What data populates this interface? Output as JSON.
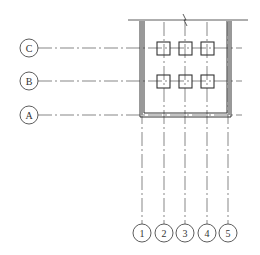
{
  "diagram": {
    "type": "structural-grid-plan",
    "colors": {
      "line": "#333333",
      "axis": "#555555",
      "wall": "#333333",
      "background": "#ffffff"
    },
    "row_axes": [
      {
        "label": "C",
        "y": 48
      },
      {
        "label": "B",
        "y": 81
      },
      {
        "label": "A",
        "y": 115
      }
    ],
    "column_axes": [
      {
        "label": "1",
        "x": 142
      },
      {
        "label": "2",
        "x": 164
      },
      {
        "label": "3",
        "x": 185
      },
      {
        "label": "4",
        "x": 207
      },
      {
        "label": "5",
        "x": 228
      }
    ],
    "columns": [
      {
        "row": "C",
        "col": "2"
      },
      {
        "row": "C",
        "col": "3"
      },
      {
        "row": "C",
        "col": "4"
      },
      {
        "row": "B",
        "col": "2"
      },
      {
        "row": "B",
        "col": "3"
      },
      {
        "row": "B",
        "col": "4"
      }
    ],
    "break_mark": "break-line-symbol"
  }
}
